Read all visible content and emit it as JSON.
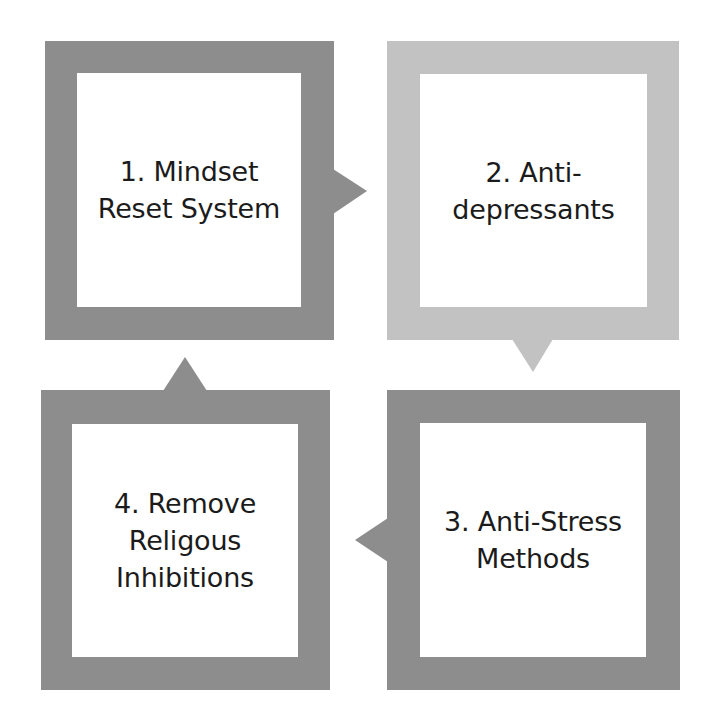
{
  "diagram": {
    "type": "cycle",
    "colors": {
      "dark_frame": "#8d8d8d",
      "light_frame": "#c2c2c2",
      "inner_fill": "#ffffff",
      "text": "#1b1b1b"
    },
    "steps": [
      {
        "number": 1,
        "label": "1. Mindset\nReset System",
        "frame_color": "#8d8d8d",
        "arrow": "right"
      },
      {
        "number": 2,
        "label": "2. Anti-\ndepressants",
        "frame_color": "#c2c2c2",
        "arrow": "down"
      },
      {
        "number": 3,
        "label": "3. Anti-Stress\nMethods",
        "frame_color": "#8d8d8d",
        "arrow": "left"
      },
      {
        "number": 4,
        "label": "4. Remove\nReligous\nInhibitions",
        "frame_color": "#8d8d8d",
        "arrow": "up"
      }
    ]
  }
}
